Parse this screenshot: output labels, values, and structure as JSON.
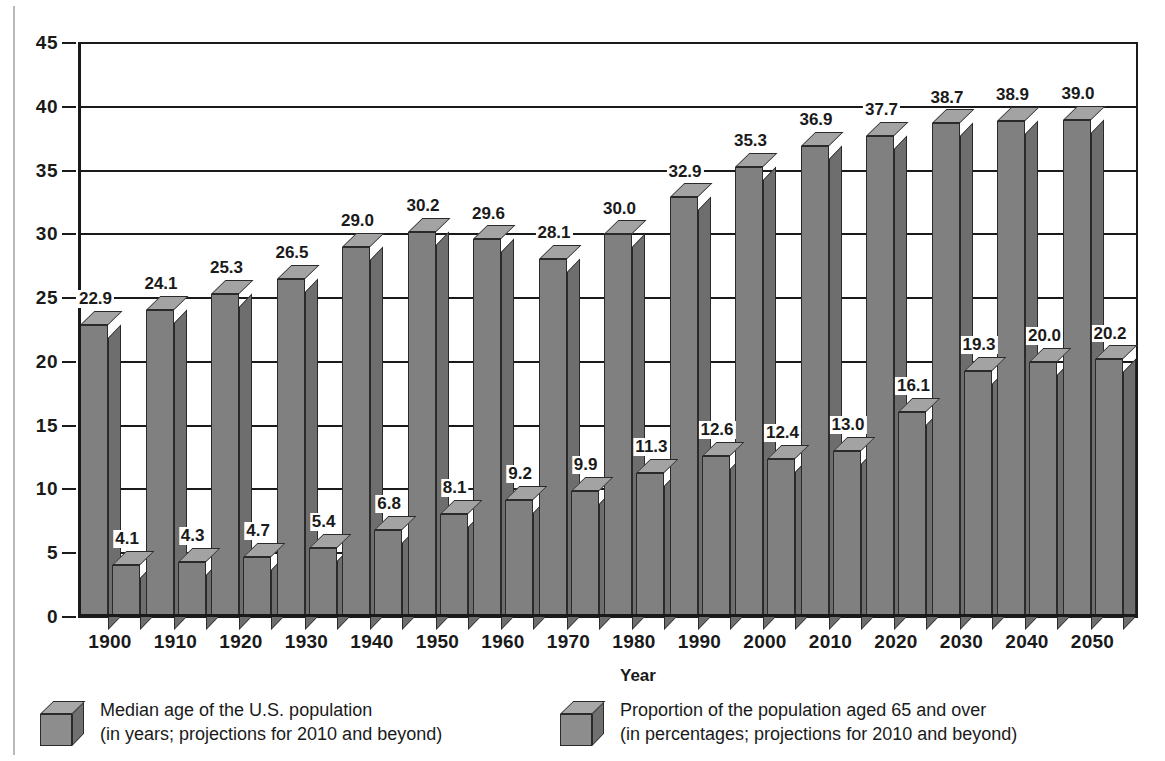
{
  "chart_data": {
    "type": "bar",
    "title": "",
    "xlabel": "Year",
    "ylabel": "",
    "ylim": [
      0,
      45
    ],
    "ytick_labels": [
      "45",
      "40",
      "35",
      "30",
      "25",
      "20",
      "15",
      "10",
      "5",
      "0"
    ],
    "yticks": [
      45,
      40,
      35,
      30,
      25,
      20,
      15,
      10,
      5,
      0
    ],
    "grid": true,
    "legend_position": "bottom",
    "categories": [
      "1900",
      "1910",
      "1920",
      "1930",
      "1940",
      "1950",
      "1960",
      "1970",
      "1980",
      "1990",
      "2000",
      "2010",
      "2020",
      "2030",
      "2040",
      "2050"
    ],
    "series": [
      {
        "name": "Median age of the U.S. population",
        "values": [
          22.9,
          24.1,
          25.3,
          26.5,
          29.0,
          30.2,
          29.6,
          28.1,
          30.0,
          32.9,
          35.3,
          36.9,
          37.7,
          38.7,
          38.9,
          39.0
        ],
        "labels": [
          "22.9",
          "24.1",
          "25.3",
          "26.5",
          "29.0",
          "30.2",
          "29.6",
          "28.1",
          "30.0",
          "32.9",
          "35.3",
          "36.9",
          "37.7",
          "38.7",
          "38.9",
          "39.0"
        ]
      },
      {
        "name": "Proportion of the population aged 65 and over",
        "values": [
          4.1,
          4.3,
          4.7,
          5.4,
          6.8,
          8.1,
          9.2,
          9.9,
          11.3,
          12.6,
          12.4,
          13.0,
          16.1,
          19.3,
          20.0,
          20.2
        ],
        "labels": [
          "4.1",
          "4.3",
          "4.7",
          "5.4",
          "6.8",
          "8.1",
          "9.2",
          "9.9",
          "11.3",
          "12.6",
          "12.4",
          "13.0",
          "16.1",
          "19.3",
          "20.0",
          "20.2"
        ]
      }
    ],
    "colors": {
      "bar_front": "#808080",
      "bar_top": "#a3a3a3",
      "bar_side": "#6e6e6e",
      "outline": "#2a2a2a",
      "axis": "#1a1a1a",
      "background": "#ffffff"
    }
  },
  "axis": {
    "x_title": "Year"
  },
  "legend": {
    "entries": [
      {
        "icon": "cube-icon",
        "line1": "Median age of the U.S. population",
        "line2": "(in years; projections for 2010 and beyond)"
      },
      {
        "icon": "cube-icon",
        "line1": "Proportion of the population aged 65 and over",
        "line2": "(in percentages; projections for 2010 and beyond)"
      }
    ]
  }
}
